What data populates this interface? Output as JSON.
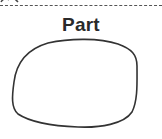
{
  "diagram": {
    "label": "Part",
    "shape": "closed-irregular-blob",
    "separator": "dashed-line",
    "colors": {
      "stroke": "#333333",
      "text": "#2a2a2a",
      "background": "#ffffff"
    }
  }
}
